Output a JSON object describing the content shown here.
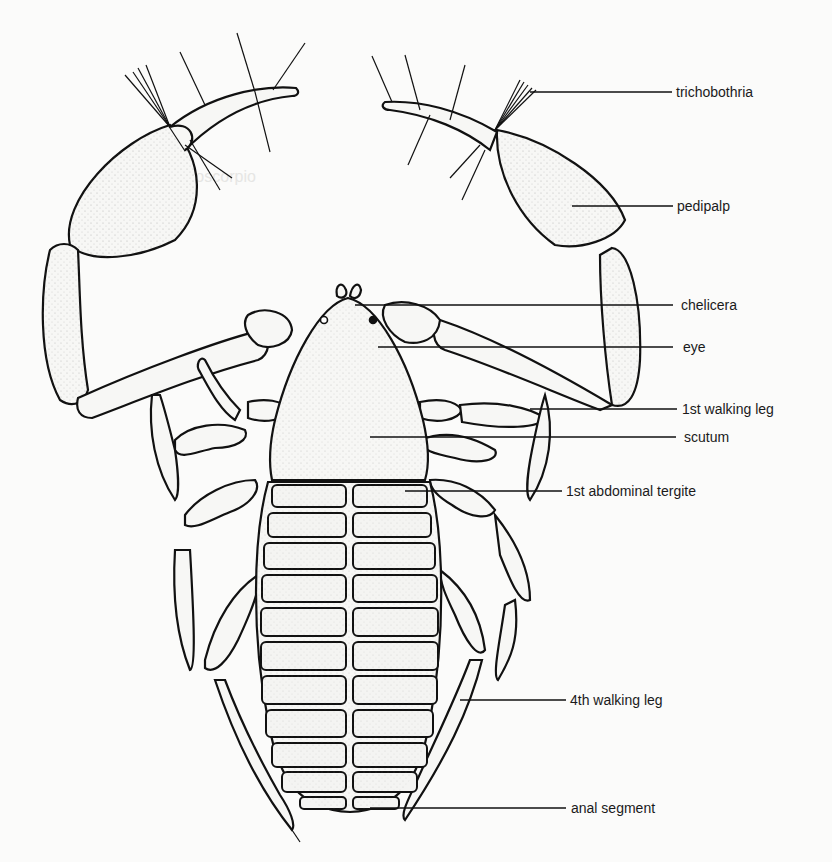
{
  "diagram": {
    "labels": [
      {
        "id": "trichobothria",
        "text": "trichobothria"
      },
      {
        "id": "pedipalp",
        "text": "pedipalp"
      },
      {
        "id": "chelicera",
        "text": "chelicera"
      },
      {
        "id": "eye",
        "text": "eye"
      },
      {
        "id": "walking_leg_1",
        "text": "1st walking leg"
      },
      {
        "id": "scutum",
        "text": "scutum"
      },
      {
        "id": "abdominal_tergite_1",
        "text": "1st abdominal tergite"
      },
      {
        "id": "walking_leg_4",
        "text": "4th walking leg"
      },
      {
        "id": "anal_segment",
        "text": "anal segment"
      }
    ],
    "colors": {
      "ink": "#111111",
      "paper": "#fbfbfa"
    }
  }
}
